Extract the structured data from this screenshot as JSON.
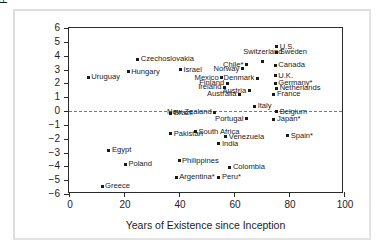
{
  "chart_data": {
    "type": "scatter",
    "title": "",
    "xlabel": "Years of Existence since Inception",
    "ylabel": "Percent per Annum",
    "xlim": [
      0,
      100
    ],
    "ylim": [
      -6,
      6
    ],
    "xticks": [
      0,
      20,
      40,
      60,
      80,
      100
    ],
    "yticks": [
      6,
      5,
      4,
      3,
      2,
      1,
      0,
      -1,
      -2,
      -3,
      -4,
      -5,
      -6
    ],
    "ytick_labels": [
      "6",
      "5",
      "4",
      "3",
      "2",
      "1",
      "0",
      "−1",
      "−2",
      "−3",
      "−4",
      "−5",
      "−6"
    ],
    "xtick_labels": [
      "0",
      "20",
      "40",
      "60",
      "80",
      "100"
    ],
    "grid": false,
    "legend": null,
    "reference_line": {
      "axis": "y",
      "value": 0,
      "style": "dashed"
    },
    "marker": "square",
    "marker_color": "#1a1a1a",
    "points": [
      {
        "label": "Uruguay",
        "x": 7,
        "y": 2.45,
        "pos": "right"
      },
      {
        "label": "Hungary",
        "x": 21.5,
        "y": 2.85,
        "pos": "right"
      },
      {
        "label": "Czechoslovakia",
        "x": 25,
        "y": 3.75,
        "pos": "right"
      },
      {
        "label": "Israel",
        "x": 40.5,
        "y": 3.0,
        "pos": "right"
      },
      {
        "label": "Mexico",
        "x": 55.5,
        "y": 2.4,
        "pos": "left"
      },
      {
        "label": "Finland",
        "x": 57.5,
        "y": 2.0,
        "pos": "left"
      },
      {
        "label": "Ireland",
        "x": 56.5,
        "y": 1.7,
        "pos": "left"
      },
      {
        "label": "Chile*",
        "x": 64.5,
        "y": 3.35,
        "pos": "left"
      },
      {
        "label": "Norway",
        "x": 63,
        "y": 3.05,
        "pos": "left"
      },
      {
        "label": "Switzerland",
        "x": 70.5,
        "y": 3.6,
        "pos": "above"
      },
      {
        "label": "Denmark",
        "x": 68.5,
        "y": 2.35,
        "pos": "left"
      },
      {
        "label": "Austria",
        "x": 65.5,
        "y": 1.45,
        "pos": "left"
      },
      {
        "label": "Australia",
        "x": 62,
        "y": 1.2,
        "pos": "left"
      },
      {
        "label": "U.S.",
        "x": 75.5,
        "y": 4.65,
        "pos": "right"
      },
      {
        "label": "Sweden",
        "x": 75.5,
        "y": 4.25,
        "pos": "right"
      },
      {
        "label": "Canada",
        "x": 75,
        "y": 3.3,
        "pos": "right"
      },
      {
        "label": "U.K.",
        "x": 75,
        "y": 2.55,
        "pos": "right"
      },
      {
        "label": "Germany*",
        "x": 75,
        "y": 2.0,
        "pos": "right"
      },
      {
        "label": "Netherlands",
        "x": 75.5,
        "y": 1.65,
        "pos": "right"
      },
      {
        "label": "France",
        "x": 74.5,
        "y": 1.2,
        "pos": "right"
      },
      {
        "label": "Italy",
        "x": 67.5,
        "y": 0.35,
        "pos": "right"
      },
      {
        "label": "Belgium",
        "x": 75.5,
        "y": -0.05,
        "pos": "right"
      },
      {
        "label": "New Zealand",
        "x": 53,
        "y": -0.1,
        "pos": "left"
      },
      {
        "label": "Brazil",
        "x": 37,
        "y": -0.15,
        "pos": "right"
      },
      {
        "label": "Portugal",
        "x": 64.5,
        "y": -0.55,
        "pos": "left"
      },
      {
        "label": "Japan*",
        "x": 74.5,
        "y": -0.6,
        "pos": "right"
      },
      {
        "label": "Pakistan",
        "x": 37,
        "y": -1.65,
        "pos": "right"
      },
      {
        "label": "South Africa",
        "x": 46,
        "y": -1.5,
        "pos": "right"
      },
      {
        "label": "Venezuela",
        "x": 57,
        "y": -1.85,
        "pos": "right"
      },
      {
        "label": "Spain*",
        "x": 79.5,
        "y": -1.8,
        "pos": "right"
      },
      {
        "label": "India",
        "x": 54.5,
        "y": -2.35,
        "pos": "right"
      },
      {
        "label": "Egypt",
        "x": 14.5,
        "y": -2.85,
        "pos": "right"
      },
      {
        "label": "Poland",
        "x": 20.5,
        "y": -3.85,
        "pos": "right"
      },
      {
        "label": "Philippines",
        "x": 40,
        "y": -3.6,
        "pos": "right"
      },
      {
        "label": "Colombia",
        "x": 58.5,
        "y": -4.05,
        "pos": "right"
      },
      {
        "label": "Argentina*",
        "x": 39,
        "y": -4.8,
        "pos": "right"
      },
      {
        "label": "Peru*",
        "x": 54.5,
        "y": -4.8,
        "pos": "right"
      },
      {
        "label": "Greece",
        "x": 12,
        "y": -5.45,
        "pos": "right"
      }
    ]
  }
}
